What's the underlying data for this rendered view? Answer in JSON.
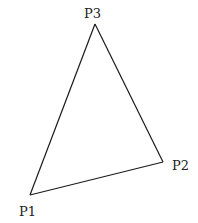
{
  "diagram": {
    "title": "",
    "shape": "triangle",
    "stroke_color": "#1a1a1a",
    "background": "#ffffff",
    "vertices": [
      {
        "id": "P1",
        "label": "P1",
        "x": 30,
        "y": 195,
        "label_x": 19,
        "label_y": 216
      },
      {
        "id": "P2",
        "label": "P2",
        "x": 163,
        "y": 162,
        "label_x": 172,
        "label_y": 170
      },
      {
        "id": "P3",
        "label": "P3",
        "x": 95,
        "y": 24,
        "label_x": 84,
        "label_y": 18
      }
    ],
    "edges": [
      {
        "from": "P1",
        "to": "P2"
      },
      {
        "from": "P2",
        "to": "P3"
      },
      {
        "from": "P3",
        "to": "P1"
      }
    ]
  }
}
